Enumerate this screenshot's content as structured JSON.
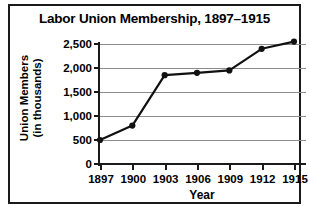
{
  "chart_data": {
    "type": "line",
    "title": "Labor Union Membership, 1897–1915",
    "xlabel": "Year",
    "ylabel_line1": "Union Members",
    "ylabel_line2": "(in thousands)",
    "x": [
      1897,
      1900,
      1903,
      1906,
      1909,
      1912,
      1915
    ],
    "xtick_labels": [
      "1897",
      "1900",
      "1903",
      "1906",
      "1909",
      "1912",
      "1915"
    ],
    "values": [
      500,
      800,
      1850,
      1900,
      1950,
      2400,
      2550
    ],
    "ytick_values": [
      0,
      500,
      1000,
      1500,
      2000,
      2500
    ],
    "ytick_labels": [
      "0",
      "500",
      "1,000",
      "1,500",
      "2,000",
      "2,500"
    ],
    "ylim": [
      0,
      2500
    ],
    "grid": true,
    "legend": "none",
    "series_color": "#111111",
    "grid_color": "#8c8c8c",
    "axis_color": "#1a1a1a",
    "marker": "circle"
  }
}
